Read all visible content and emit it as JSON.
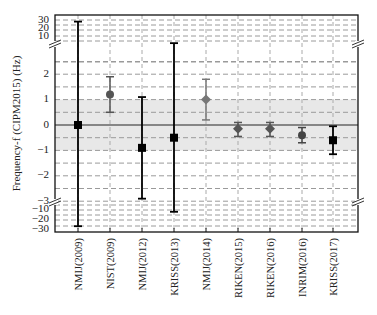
{
  "chart_data": {
    "type": "scatter",
    "subtype": "errorbar",
    "title": "",
    "xlabel": "",
    "ylabel": "Frequency-f (CIPM2015) (Hz)",
    "y_axis": {
      "broken": true,
      "upper_segment_ticks": [
        "10",
        "20",
        "30"
      ],
      "main_segment_ticks": [
        "-3",
        "-2",
        "-1",
        "0",
        "1",
        "2"
      ],
      "lower_segment_ticks": [
        "-10",
        "-20",
        "-30"
      ],
      "main_range": [
        -3,
        3
      ]
    },
    "shaded_band": {
      "from": -1,
      "to": 1,
      "color": "#e8e8e8"
    },
    "reference_line": 0,
    "grid": true,
    "categories": [
      "NMIJ(2009)",
      "NIST(2009)",
      "NMIJ(2012)",
      "KRISS(2013)",
      "NMIJ(2014)",
      "RIKEN(2015)",
      "RIKEN(2016)",
      "INRIM(2016)",
      "KRISS(2017)"
    ],
    "points": [
      {
        "label": "NMIJ(2009)",
        "value": 0.0,
        "err_high": 28,
        "err_low": -28,
        "marker": "square",
        "color": "#000000"
      },
      {
        "label": "NIST(2009)",
        "value": 1.2,
        "err_high": 1.9,
        "err_low": 0.5,
        "marker": "circle",
        "color": "#555555"
      },
      {
        "label": "NMIJ(2012)",
        "value": -0.9,
        "err_high": 1.1,
        "err_low": -2.9,
        "marker": "square",
        "color": "#000000"
      },
      {
        "label": "KRISS(2013)",
        "value": -0.5,
        "err_high": 5,
        "err_low": -12,
        "marker": "square",
        "color": "#000000"
      },
      {
        "label": "NMIJ(2014)",
        "value": 1.0,
        "err_high": 1.8,
        "err_low": 0.2,
        "marker": "diamond",
        "color": "#777777"
      },
      {
        "label": "RIKEN(2015)",
        "value": -0.15,
        "err_high": 0.1,
        "err_low": -0.45,
        "marker": "diamond",
        "color": "#555555"
      },
      {
        "label": "RIKEN(2016)",
        "value": -0.15,
        "err_high": 0.1,
        "err_low": -0.45,
        "marker": "diamond",
        "color": "#555555"
      },
      {
        "label": "INRIM(2016)",
        "value": -0.4,
        "err_high": -0.1,
        "err_low": -0.7,
        "marker": "circle",
        "color": "#444444"
      },
      {
        "label": "KRISS(2017)",
        "value": -0.6,
        "err_high": -0.05,
        "err_low": -1.15,
        "marker": "square",
        "color": "#000000"
      }
    ]
  },
  "labels": {
    "ylabel": "Frequency-f (CIPM2015) (Hz)",
    "ticks_upper": [
      "30",
      "20",
      "10"
    ],
    "ticks_main": [
      "2",
      "1",
      "0",
      "−1",
      "−2",
      "−3"
    ],
    "ticks_lower": [
      "−10",
      "−20",
      "−30"
    ]
  }
}
